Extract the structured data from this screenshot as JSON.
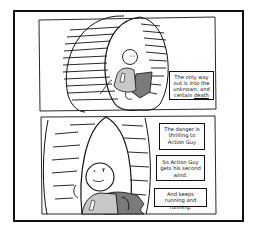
{
  "comic": {
    "character": "Action Guy",
    "panels": [
      {
        "index": 1,
        "scene": "action-guy-running-in-hamster-wheel",
        "captions": [
          {
            "text_pre": "The only way out is into the unknown, and certain ",
            "emphasis": "death"
          }
        ]
      },
      {
        "index": 2,
        "scene": "action-guy-close-up-smiling-in-wheel",
        "captions": [
          {
            "text": "The danger is thrilling to Action Guy"
          },
          {
            "text": "So Action Guy gets his second wind."
          },
          {
            "text": "And keeps running and running."
          }
        ]
      }
    ],
    "colors": {
      "ink": "#111111",
      "background": "#ffffff",
      "cape": "#7a7a7a",
      "suit": "#c8c8c8"
    }
  }
}
